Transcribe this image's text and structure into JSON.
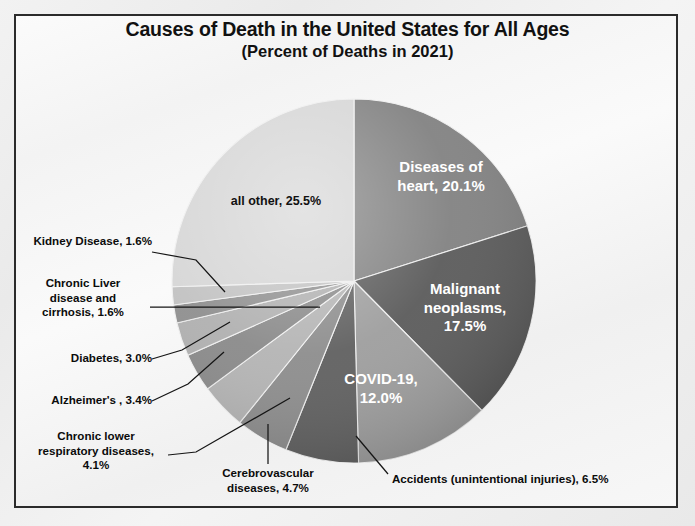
{
  "figure": {
    "title_main": "Causes of Death in the United States for All Ages",
    "title_sub": "(Percent of Deaths in 2021)",
    "border_color": "#2b2b2b",
    "background_color": "#f4f4f4"
  },
  "chart_data": {
    "type": "pie",
    "title": "Causes of Death in the United States for All Ages (Percent of Deaths in 2021)",
    "xlabel": "",
    "ylabel": "",
    "units": "percent of deaths",
    "year": "2021",
    "start_angle_deg": 0,
    "direction": "clockwise",
    "legend": "none",
    "grid": false,
    "categories": [
      "Diseases of heart",
      "Malignant neoplasms",
      "COVID-19",
      "Accidents (unintentional injuries)",
      "Cerebrovascular diseases",
      "Chronic lower respiratory diseases",
      "Alzheimer's",
      "Diabetes",
      "Chronic Liver disease and cirrhosis",
      "Kidney Disease",
      "all other"
    ],
    "values": [
      20.1,
      17.5,
      12.0,
      6.5,
      4.7,
      4.1,
      3.4,
      3.0,
      1.6,
      1.6,
      25.5
    ],
    "slices": [
      {
        "label": "Diseases of heart",
        "value": 20.1,
        "display": "Diseases of heart, 20.1%",
        "color": "#828282",
        "label_placement": "inside",
        "label_color": "#ffffff"
      },
      {
        "label": "Malignant neoplasms",
        "value": 17.5,
        "display": "Malignant neoplasms, 17.5%",
        "color": "#5b5b5b",
        "label_placement": "inside",
        "label_color": "#ffffff"
      },
      {
        "label": "COVID-19",
        "value": 12.0,
        "display": "COVID-19, 12.0%",
        "color": "#9e9e9e",
        "label_placement": "inside",
        "label_color": "#ffffff"
      },
      {
        "label": "Accidents (unintentional injuries)",
        "value": 6.5,
        "display": "Accidents (unintentional injuries), 6.5%",
        "color": "#606060",
        "label_placement": "callout",
        "label_color": "#0b0b0b"
      },
      {
        "label": "Cerebrovascular diseases",
        "value": 4.7,
        "display": "Cerebrovascular diseases, 4.7%",
        "color": "#8d8d8d",
        "label_placement": "callout",
        "label_color": "#0b0b0b"
      },
      {
        "label": "Chronic lower respiratory diseases",
        "value": 4.1,
        "display": "Chronic lower respiratory diseases, 4.1%",
        "color": "#b4b4b4",
        "label_placement": "callout",
        "label_color": "#0b0b0b"
      },
      {
        "label": "Alzheimer's",
        "value": 3.4,
        "display": "Alzheimer's , 3.4%",
        "color": "#8a8a8a",
        "label_placement": "callout",
        "label_color": "#0b0b0b"
      },
      {
        "label": "Diabetes",
        "value": 3.0,
        "display": "Diabetes, 3.0%",
        "color": "#b0b0b0",
        "label_placement": "callout",
        "label_color": "#0b0b0b"
      },
      {
        "label": "Chronic Liver disease and cirrhosis",
        "value": 1.6,
        "display": "Chronic Liver disease and cirrhosis, 1.6%",
        "color": "#8f8f8f",
        "label_placement": "callout",
        "label_color": "#0b0b0b"
      },
      {
        "label": "Kidney Disease",
        "value": 1.6,
        "display": "Kidney Disease, 1.6%",
        "color": "#c2c2c2",
        "label_placement": "callout",
        "label_color": "#0b0b0b"
      },
      {
        "label": "all other",
        "value": 25.5,
        "display": "all other, 25.5%",
        "color": "#d6d6d6",
        "label_placement": "inside",
        "label_color": "#111111"
      }
    ]
  },
  "inside_labels": {
    "heart_line1": "Diseases of",
    "heart_line2": "heart, 20.1%",
    "malignant_line1": "Malignant",
    "malignant_line2": "neoplasms,",
    "malignant_line3": "17.5%",
    "covid_line1": "COVID-19,",
    "covid_line2": "12.0%",
    "allother": "all other, 25.5%"
  },
  "callouts": {
    "kidney": "Kidney Disease, 1.6%",
    "liver_line1": "Chronic Liver",
    "liver_line2": "disease and",
    "liver_line3": "cirrhosis, 1.6%",
    "diabetes": "Diabetes, 3.0%",
    "alzheimers": "Alzheimer's , 3.4%",
    "clrd_line1": "Chronic lower",
    "clrd_line2": "respiratory diseases,",
    "clrd_line3": "4.1%",
    "cerebro_line1": "Cerebrovascular",
    "cerebro_line2": "diseases, 4.7%",
    "accidents": "Accidents (unintentional injuries), 6.5%"
  }
}
